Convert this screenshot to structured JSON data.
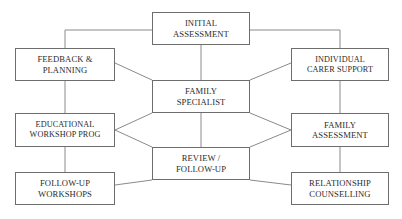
{
  "diagram": {
    "type": "flowchart",
    "canvas": {
      "width": 402,
      "height": 219,
      "background": "#ffffff"
    },
    "style": {
      "box_border_color": "#6d6d6d",
      "line_color": "#8a8a8a",
      "text_color": "#2b2b2b"
    },
    "nodes": [
      {
        "id": "initial-assessment",
        "label": "INITIAL\nASSESSMENT",
        "x": 152,
        "y": 12,
        "w": 98,
        "h": 33
      },
      {
        "id": "feedback-planning",
        "label": "FEEDBACK &\nPLANNING",
        "x": 15,
        "y": 48,
        "w": 100,
        "h": 33
      },
      {
        "id": "individual-carer-support",
        "label": "INDIVIDUAL\nCARER SUPPORT",
        "x": 291,
        "y": 48,
        "w": 98,
        "h": 33
      },
      {
        "id": "family-specialist",
        "label": "FAMILY\nSPECIALIST",
        "x": 152,
        "y": 80,
        "w": 98,
        "h": 33
      },
      {
        "id": "educational-workshop-prog",
        "label": "EDUCATIONAL\nWORKSHOP PROG",
        "x": 15,
        "y": 113,
        "w": 100,
        "h": 34
      },
      {
        "id": "family-assessment",
        "label": "FAMILY\nASSESSMENT",
        "x": 291,
        "y": 113,
        "w": 98,
        "h": 34
      },
      {
        "id": "review-follow-up",
        "label": "REVIEW /\nFOLLOW-UP",
        "x": 152,
        "y": 147,
        "w": 98,
        "h": 33
      },
      {
        "id": "follow-up-workshops",
        "label": "FOLLOW-UP\nWORKSHOPS",
        "x": 15,
        "y": 172,
        "w": 100,
        "h": 33
      },
      {
        "id": "relationship-counselling",
        "label": "RELATIONSHIP\nCOUNSELLING",
        "x": 291,
        "y": 172,
        "w": 98,
        "h": 33
      }
    ],
    "connectors": [
      {
        "id": "initial-to-feedback",
        "from": "initial-assessment",
        "to": "feedback-planning",
        "path": "M 152 30 L 65 30 L 65 48"
      },
      {
        "id": "initial-to-carer-support",
        "from": "initial-assessment",
        "to": "individual-carer-support",
        "path": "M 250 30 L 340 30 L 340 48"
      },
      {
        "id": "initial-to-specialist",
        "from": "initial-assessment",
        "to": "family-specialist",
        "path": "M 201 45 L 201 80"
      },
      {
        "id": "feedback-to-specialist",
        "from": "feedback-planning",
        "to": "family-specialist",
        "path": "M 115 63 L 152 80"
      },
      {
        "id": "carer-support-to-specialist",
        "from": "individual-carer-support",
        "to": "family-specialist",
        "path": "M 291 63 L 250 80"
      },
      {
        "id": "feedback-to-educational",
        "from": "feedback-planning",
        "to": "educational-workshop-prog",
        "path": "M 65 81 L 65 113"
      },
      {
        "id": "carer-support-to-family-assessment",
        "from": "individual-carer-support",
        "to": "family-assessment",
        "path": "M 340 81 L 340 113"
      },
      {
        "id": "specialist-to-review",
        "from": "family-specialist",
        "to": "review-follow-up",
        "path": "M 201 113 L 201 147"
      },
      {
        "id": "educational-to-specialist",
        "from": "educational-workshop-prog",
        "to": "family-specialist",
        "path": "M 115 130 L 152 113"
      },
      {
        "id": "educational-to-review",
        "from": "educational-workshop-prog",
        "to": "review-follow-up",
        "path": "M 115 130 L 152 147"
      },
      {
        "id": "family-assessment-to-specialist",
        "from": "family-assessment",
        "to": "family-specialist",
        "path": "M 291 130 L 250 113"
      },
      {
        "id": "family-assessment-to-review",
        "from": "family-assessment",
        "to": "review-follow-up",
        "path": "M 291 130 L 250 147"
      },
      {
        "id": "educational-to-follow-up-workshops",
        "from": "educational-workshop-prog",
        "to": "follow-up-workshops",
        "path": "M 65 147 L 65 172"
      },
      {
        "id": "family-assessment-to-relationship",
        "from": "family-assessment",
        "to": "relationship-counselling",
        "path": "M 340 147 L 340 172"
      },
      {
        "id": "review-to-follow-up-workshops",
        "from": "review-follow-up",
        "to": "follow-up-workshops",
        "path": "M 152 180 L 115 185"
      },
      {
        "id": "review-to-relationship",
        "from": "review-follow-up",
        "to": "relationship-counselling",
        "path": "M 250 180 L 291 185"
      }
    ]
  }
}
